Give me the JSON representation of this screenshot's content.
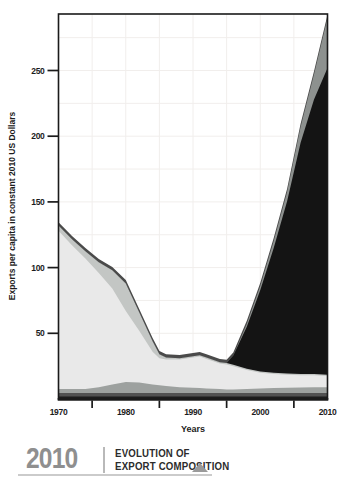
{
  "chart_data": {
    "type": "area",
    "stacked": true,
    "xlabel": "Years",
    "ylabel": "Exports per capita in constant 2010 US Dollars",
    "xlim": [
      1970,
      2010
    ],
    "ylim": [
      0,
      293
    ],
    "yticks": [
      50,
      100,
      150,
      200,
      250
    ],
    "ytick_labels": [
      "50",
      "100",
      "150",
      "200",
      "250"
    ],
    "xticks_labeled": [
      1970,
      1980,
      1990,
      2000,
      2010
    ],
    "xtick_labels": [
      "1970",
      "1980",
      "1990",
      "2000",
      "2010"
    ],
    "xticks_minor": [
      1975,
      1985,
      1995,
      2005
    ],
    "grid": true,
    "ygrid_step": 25,
    "xgrid_step": 5,
    "grid_color": "#f1eeec",
    "frame_color": "#1a1a1a",
    "tick_label_color": "#1c1c1c",
    "legend": "none",
    "years": [
      1970,
      1972,
      1974,
      1976,
      1978,
      1980,
      1982,
      1984,
      1985,
      1986,
      1988,
      1990,
      1991,
      1992,
      1994,
      1995,
      1996,
      1998,
      2000,
      2002,
      2004,
      2006,
      2008,
      2010
    ],
    "series": [
      {
        "name": "thin-black-base",
        "color": "#1c1c1c",
        "values": [
          2,
          2,
          2,
          2,
          2,
          2,
          2,
          2,
          2,
          2,
          2,
          2,
          2,
          2,
          2,
          2,
          2,
          2,
          2,
          2,
          2,
          2,
          2,
          2
        ]
      },
      {
        "name": "thin-darkgray-base",
        "color": "#515151",
        "values": [
          2.5,
          2.5,
          2.5,
          2.5,
          2.5,
          2.5,
          2.5,
          2.5,
          2.5,
          2.5,
          2.5,
          2.5,
          2.5,
          2.5,
          2.5,
          2.5,
          2.5,
          2.5,
          2.5,
          2.5,
          2.5,
          2.5,
          2.5,
          2.5
        ]
      },
      {
        "name": "gray-base-band",
        "color": "#9da19f",
        "values": [
          3,
          3,
          3,
          4.5,
          6.5,
          8.5,
          8,
          6.5,
          6,
          5.5,
          4.5,
          4,
          3.8,
          3.5,
          3,
          2.8,
          2.8,
          3,
          3.5,
          3.8,
          4,
          4.2,
          4.4,
          4.5
        ]
      },
      {
        "name": "lightgray-main",
        "color": "#e9e9e9",
        "values": [
          120.5,
          109.5,
          99.5,
          87,
          73,
          54,
          39.5,
          25,
          20.5,
          20,
          21,
          23,
          24,
          22.5,
          19.5,
          19,
          17.7,
          14.5,
          12,
          10.7,
          10,
          9.3,
          9.1,
          8.5
        ]
      },
      {
        "name": "silver-bump",
        "color": "#c3c6c4",
        "values": [
          4,
          4.5,
          5.5,
          8,
          14,
          21,
          14,
          8,
          3,
          1.5,
          1,
          1,
          1,
          1,
          1,
          1,
          1,
          1,
          1,
          1,
          1,
          1,
          1,
          1
        ]
      },
      {
        "name": "black-rising",
        "color": "#141414",
        "values": [
          0,
          0,
          0,
          0,
          0,
          0,
          0,
          0,
          0,
          0,
          0,
          0,
          0,
          0,
          0,
          0,
          7,
          32,
          62,
          95,
          131,
          176,
          209,
          233.5
        ]
      },
      {
        "name": "gray-wedge",
        "color": "#8d918f",
        "values": [
          0,
          0,
          0,
          0,
          0,
          0,
          0,
          0,
          0,
          0,
          0,
          0,
          0,
          0,
          0,
          0,
          0,
          2,
          3,
          5,
          7,
          12,
          19,
          38
        ]
      },
      {
        "name": "darkgray-topline",
        "color": "#4a4a4a",
        "values": [
          2.5,
          2.5,
          2.5,
          2.5,
          2.5,
          2.5,
          2.5,
          2.5,
          2.5,
          2.5,
          2.5,
          2.5,
          2.5,
          2.5,
          2.5,
          2.5,
          2.5,
          2.5,
          2.5,
          2.5,
          2.5,
          2.5,
          2.5,
          2.5
        ]
      }
    ]
  },
  "footer": {
    "year": "2010",
    "title_line1": "EVOLUTION OF",
    "title_line2": "EXPORT COMPOSITION",
    "year_color": "#8f8f8f",
    "title_color": "#2c2c2c",
    "triangle_icon_color": "#9a9a9a"
  }
}
